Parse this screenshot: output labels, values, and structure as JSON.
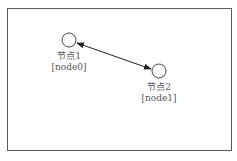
{
  "diagram": {
    "nodes": [
      {
        "name": "节点1",
        "id": "[node0]"
      },
      {
        "name": "节点2",
        "id": "[node1]"
      }
    ],
    "edges": [
      {
        "from": "node0",
        "to": "node1",
        "direction": "bidirectional"
      }
    ],
    "colors": {
      "border": "#5a5a5a",
      "node_stroke": "#444444",
      "edge": "#222222",
      "text": "#555555"
    }
  }
}
